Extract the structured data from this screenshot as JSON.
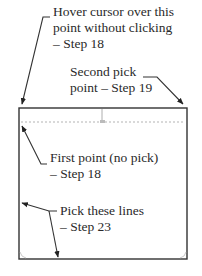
{
  "diagram": {
    "type": "annotated-cad-callout",
    "colors": {
      "line": "#333333",
      "dashed_guide": "#aaaaaa",
      "text": "#2a2a2a",
      "background": "#ffffff"
    },
    "callouts": [
      {
        "id": "hover-point",
        "lines": [
          "Hover cursor over this",
          "point without clicking",
          "– Step 18"
        ]
      },
      {
        "id": "second-pick",
        "lines": [
          "Second pick",
          "point – Step 19"
        ]
      },
      {
        "id": "first-point",
        "lines": [
          "First point (no pick)",
          "– Step 18"
        ]
      },
      {
        "id": "pick-lines",
        "lines": [
          "Pick these lines",
          "– Step 23"
        ]
      }
    ]
  }
}
